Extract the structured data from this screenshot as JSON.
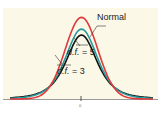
{
  "chart_data": {
    "type": "line",
    "title": "",
    "xlabel": "",
    "ylabel": "",
    "x_ticks": [
      "0"
    ],
    "grid": false,
    "legend_position": "inline-annotations",
    "series": [
      {
        "name": "Normal",
        "color": "#e0393b",
        "peak_y": 0.399,
        "description": "standard normal density"
      },
      {
        "name": "d.f. = 5",
        "color": "#2b9a9c",
        "peak_y": 0.38,
        "description": "t-distribution, 5 degrees of freedom"
      },
      {
        "name": "d.f. = 3",
        "color": "#111111",
        "peak_y": 0.368,
        "description": "t-distribution, 3 degrees of freedom"
      }
    ],
    "x": [
      -3.5,
      3.5
    ],
    "ylim": [
      0,
      0.42
    ]
  },
  "labels": {
    "normal": "Normal",
    "df5_prefix": "d.f.",
    "df5_suffix": " = 5",
    "df3_prefix": "d.f.",
    "df3_suffix": " = 3",
    "tick0": "0"
  },
  "colors": {
    "background": "#fbf8e8",
    "axis": "#9a9a9a",
    "normal": "#e0393b",
    "df5": "#2b9a9c",
    "df3": "#111111"
  }
}
